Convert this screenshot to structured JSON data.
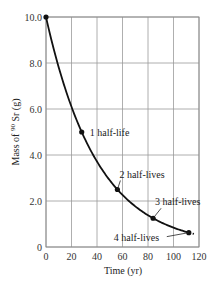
{
  "chart_data": {
    "type": "line",
    "title": "",
    "xlabel": "Time (yr)",
    "ylabel": "Mass of 90Sr (g)",
    "ylabel_parts": {
      "pre": "Mass of ",
      "sup": "90",
      "post": " Sr (g)"
    },
    "xlim": [
      0,
      120
    ],
    "ylim": [
      0,
      10
    ],
    "grid": true,
    "legend": null,
    "x_ticks": [
      0,
      20,
      40,
      60,
      80,
      100,
      120
    ],
    "x_tick_labels": [
      "0",
      "20",
      "40",
      "60",
      "80",
      "100",
      "120"
    ],
    "y_ticks": [
      0,
      2,
      4,
      6,
      8,
      10
    ],
    "y_tick_labels": [
      "0",
      "2.0",
      "4.0",
      "6.0",
      "8.0",
      "10.0"
    ],
    "series": [
      {
        "name": "90Sr decay",
        "x": [
          0,
          28,
          56,
          84,
          112,
          116
        ],
        "values": [
          10.0,
          5.0,
          2.5,
          1.25,
          0.625,
          0.5
        ]
      }
    ],
    "annotations": [
      {
        "text": "1 half-life",
        "x": 28,
        "y": 5.0
      },
      {
        "text": "2 half-lives",
        "x": 56,
        "y": 2.5
      },
      {
        "text": "3 half-lives",
        "x": 84,
        "y": 1.25
      },
      {
        "text": "4 half-lives",
        "x": 112,
        "y": 0.625
      }
    ],
    "marked_points": [
      {
        "x": 0,
        "y": 10.0
      },
      {
        "x": 28,
        "y": 5.0
      },
      {
        "x": 56,
        "y": 2.5
      },
      {
        "x": 84,
        "y": 1.25
      },
      {
        "x": 112,
        "y": 0.625
      }
    ]
  }
}
